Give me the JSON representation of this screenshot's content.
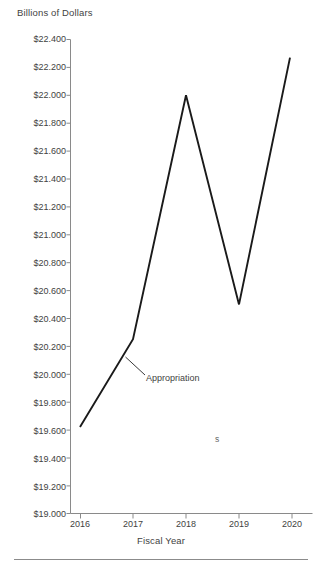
{
  "chart_data": {
    "type": "line",
    "title": "",
    "ylabel": "Billions of Dollars",
    "xlabel": "Fiscal Year",
    "x": [
      "2016",
      "2017",
      "2018",
      "2019",
      "2020"
    ],
    "categories": [
      "2016",
      "2017",
      "2018",
      "2019",
      "2020"
    ],
    "series": [
      {
        "name": "Appropriation",
        "values": [
          19.62,
          20.25,
          22.0,
          20.5,
          22.27
        ]
      }
    ],
    "ylim": [
      19.0,
      22.4
    ],
    "ytick_labels": [
      "$22.400",
      "$22.200",
      "$22.000",
      "$21.800",
      "$21.600",
      "$21.400",
      "$21.200",
      "$21.000",
      "$20.800",
      "$20.600",
      "$20.400",
      "$20.200",
      "$20.000",
      "$19.800",
      "$19.600",
      "$19.400",
      "$19.200",
      "$19.000"
    ],
    "ytick_values": [
      22.4,
      22.2,
      22.0,
      21.8,
      21.6,
      21.4,
      21.2,
      21.0,
      20.8,
      20.6,
      20.4,
      20.2,
      20.0,
      19.8,
      19.6,
      19.4,
      19.2,
      19.0
    ],
    "xtick_labels": [
      "2016",
      "2017",
      "2018",
      "2019",
      "2020"
    ],
    "grid": false,
    "legend": "none",
    "annotations": [
      {
        "text": "Appropriation",
        "x_pixel": 146,
        "y_pixel": 379
      },
      {
        "text": "s",
        "x_pixel": 218,
        "y_pixel": 441
      }
    ],
    "line_color": "#1a1a1a",
    "axis_color": "#8a8a8a",
    "text_color": "#3f3f3f"
  },
  "figure": {
    "background": "#ffffff"
  }
}
